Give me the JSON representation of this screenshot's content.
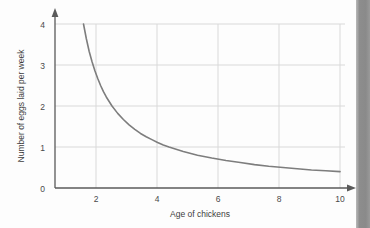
{
  "chart_data": {
    "type": "line",
    "title": "",
    "subtitle": "",
    "xlabel": "Age of chickens",
    "ylabel": "Number of eggs laid per week",
    "xlim": [
      0,
      10.6
    ],
    "ylim": [
      0,
      4.3
    ],
    "xticks": [
      2,
      4,
      6,
      8,
      10
    ],
    "xtick_labels": [
      "2",
      "4",
      "6",
      "8",
      "10"
    ],
    "yticks": [
      0,
      1,
      2,
      3,
      4
    ],
    "ytick_labels": [
      "0",
      "1",
      "2",
      "3",
      "4"
    ],
    "grid": true,
    "legend": "none",
    "annotations": [],
    "series": [
      {
        "name": "eggs laid per week",
        "relationship": "y = 4 / x",
        "color": "#7d7d7d",
        "x": [
          1.0,
          1.1,
          1.2,
          1.3,
          1.4,
          1.5,
          1.6,
          1.7,
          1.8,
          1.9,
          2.0,
          2.2,
          2.4,
          2.6,
          2.8,
          3.0,
          3.2,
          3.4,
          3.6,
          3.8,
          4.0,
          4.5,
          5.0,
          5.5,
          6.0,
          6.5,
          7.0,
          7.5,
          8.0,
          8.5,
          9.0,
          9.5,
          10.0
        ],
        "values": [
          4.0,
          3.64,
          3.33,
          3.08,
          2.86,
          2.67,
          2.5,
          2.35,
          2.22,
          2.11,
          2.0,
          1.82,
          1.67,
          1.54,
          1.43,
          1.33,
          1.25,
          1.18,
          1.11,
          1.05,
          1.0,
          0.89,
          0.8,
          0.73,
          0.67,
          0.62,
          0.57,
          0.53,
          0.5,
          0.47,
          0.44,
          0.42,
          0.4
        ]
      }
    ]
  },
  "axis_labels": {
    "x_title": "Age of chickens",
    "y_title": "Number of eggs laid per week"
  },
  "colors": {
    "curve": "#7d7d7d",
    "axis": "#5a5a5a",
    "grid": "#d9d9d9",
    "text": "#3d3d3d",
    "page_edge": "#8a8a8a",
    "background": "#fdfdfd"
  }
}
